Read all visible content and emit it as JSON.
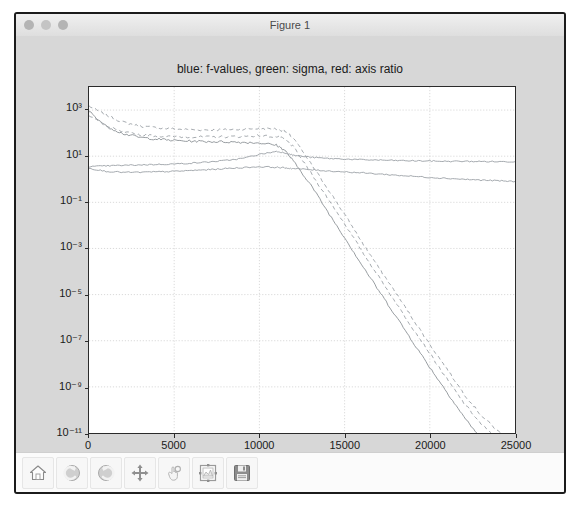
{
  "window": {
    "title": "Figure 1",
    "controls": [
      {
        "name": "close-button",
        "color": "#b4b4b4"
      },
      {
        "name": "minimize-button",
        "color": "#c4c4c4"
      },
      {
        "name": "zoom-button",
        "color": "#b4b4b4"
      }
    ]
  },
  "toolbar": {
    "buttons": [
      {
        "name": "home-button",
        "icon": "home-icon",
        "label": "Home"
      },
      {
        "name": "back-button",
        "icon": "back-arrow-icon",
        "label": "Back"
      },
      {
        "name": "forward-button",
        "icon": "forward-arrow-icon",
        "label": "Forward"
      },
      {
        "name": "pan-button",
        "icon": "move-cross-icon",
        "label": "Pan"
      },
      {
        "name": "zoom-button",
        "icon": "zoom-hand-icon",
        "label": "Zoom"
      },
      {
        "name": "subplots-button",
        "icon": "subplot-config-icon",
        "label": "Configure subplots"
      },
      {
        "name": "save-button",
        "icon": "floppy-disk-icon",
        "label": "Save"
      }
    ]
  },
  "chart_data": {
    "type": "line",
    "title": "blue: f-values, green: sigma, red: axis ratio",
    "xlabel": "",
    "ylabel": "",
    "xlim": [
      0,
      25000
    ],
    "ylim": [
      1e-11,
      10000.0
    ],
    "yscale": "log",
    "grid": true,
    "legend_position": "none",
    "xticks": [
      0,
      5000,
      10000,
      15000,
      20000,
      25000
    ],
    "xticklabels": [
      "0",
      "5000",
      "10000",
      "15000",
      "20000",
      "25000"
    ],
    "yticks": [
      1000.0,
      10.0,
      0.1,
      0.001,
      1e-05,
      1e-07,
      1e-09,
      1e-11
    ],
    "yticklabels": [
      "10³",
      "10¹",
      "10⁻¹",
      "10⁻³",
      "10⁻⁵",
      "10⁻⁷",
      "10⁻⁹",
      "10⁻¹¹"
    ],
    "x": [
      0,
      1000,
      2000,
      3000,
      4000,
      5000,
      6000,
      7000,
      8000,
      9000,
      10000,
      11000,
      11500,
      12000,
      13000,
      14000,
      15000,
      16000,
      17000,
      18000,
      19000,
      20000,
      21000,
      22000,
      23000,
      24000,
      25000
    ],
    "series": [
      {
        "name": "sigma-upper",
        "color": "#9aa0a6",
        "style": "dashed",
        "values": [
          1500,
          600,
          300,
          200,
          170,
          150,
          140,
          140,
          140,
          150,
          160,
          150,
          120,
          60,
          5,
          0.4,
          0.03,
          0.002,
          0.00015,
          1.2e-05,
          9e-07,
          7e-08,
          6e-09,
          5e-10,
          6e-11,
          1.2e-11,
          3e-12
        ]
      },
      {
        "name": "sigma-lower",
        "color": "#9aa0a6",
        "style": "dashed",
        "values": [
          600,
          200,
          110,
          85,
          75,
          70,
          68,
          68,
          70,
          72,
          78,
          70,
          55,
          25,
          2,
          0.15,
          0.012,
          0.0008,
          6e-05,
          4.5e-06,
          3.5e-07,
          2.8e-08,
          2.2e-09,
          2e-10,
          2.5e-11,
          5e-12,
          1.2e-12
        ]
      },
      {
        "name": "f-values",
        "color": "#8c9196",
        "style": "solid",
        "values": [
          900,
          200,
          95,
          65,
          55,
          48,
          45,
          43,
          42,
          40,
          38,
          30,
          18,
          6,
          0.6,
          0.04,
          0.003,
          0.0002,
          1.5e-05,
          1.2e-06,
          9e-08,
          7e-09,
          6e-10,
          5e-11,
          6e-12,
          1.2e-12,
          2e-13
        ]
      },
      {
        "name": "axis-ratio-upper",
        "color": "#9aa0a6",
        "style": "solid",
        "values": [
          3.5,
          3.8,
          4.0,
          4.2,
          4.4,
          4.6,
          5.0,
          5.6,
          6.5,
          8.0,
          12.0,
          16.0,
          14.0,
          11.0,
          9.0,
          8.0,
          7.5,
          7.0,
          6.8,
          6.5,
          6.3,
          6.2,
          6.0,
          6.0,
          5.9,
          5.8,
          5.8
        ]
      },
      {
        "name": "axis-ratio-lower",
        "color": "#9aa0a6",
        "style": "solid",
        "values": [
          3.0,
          2.2,
          2.0,
          2.0,
          2.1,
          2.2,
          2.4,
          2.6,
          2.9,
          3.2,
          3.5,
          3.3,
          3.1,
          2.9,
          2.6,
          2.3,
          2.1,
          1.9,
          1.7,
          1.5,
          1.35,
          1.2,
          1.1,
          1.0,
          0.92,
          0.86,
          0.8
        ]
      }
    ]
  }
}
